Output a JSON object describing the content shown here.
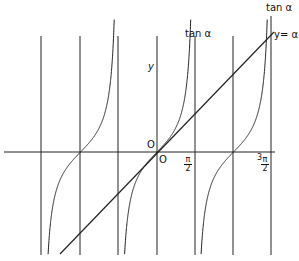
{
  "diagram": {
    "title": "",
    "labels": {
      "tan_top": "tan α",
      "tan_mid": "tan α",
      "line": "y= α",
      "y_axis": "y",
      "origin_upper": "O",
      "origin_lower": "O",
      "half_pi_num": "π",
      "half_pi_den": "2",
      "three_half_pi_coef": "3",
      "three_half_pi_num": "π",
      "three_half_pi_den": "2"
    },
    "colors": {
      "line": "#222222",
      "background": "#ffffff"
    }
  },
  "chart_data": {
    "type": "line",
    "title": "",
    "xlabel": "α",
    "ylabel": "y",
    "series": [
      {
        "name": "tan α",
        "function": "tan(α)",
        "domain": [
          -4.71,
          4.71
        ]
      },
      {
        "name": "y = α",
        "function": "α",
        "domain": [
          -4.0,
          4.8
        ]
      }
    ],
    "vertical_lines": [
      -4.712,
      -3.1416,
      -1.5708,
      0,
      1.5708,
      3.1416,
      4.712
    ],
    "x_ticks": [
      {
        "value": 1.5708,
        "label": "π/2"
      },
      {
        "value": 4.712,
        "label": "3π/2"
      }
    ],
    "origin_label": "O",
    "grid": false
  }
}
